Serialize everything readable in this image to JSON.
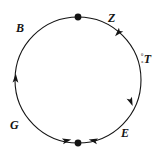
{
  "diagram": {
    "type": "circular-cycle-diagram",
    "background_color": "#ffffff",
    "stroke_color": "#141414",
    "circle": {
      "center_x": 78,
      "center_y": 80,
      "radius": 63,
      "stroke_width": 1.1
    },
    "labels": {
      "b": "B",
      "z": "Z",
      "g": "G",
      "e": "E",
      "t_superscript": "0",
      "t_subscript": "a",
      "t_main": "T"
    },
    "node_markers": [
      {
        "name": "top-node",
        "x": 78,
        "y": 17,
        "radius": 3.4
      },
      {
        "name": "bottom-node",
        "x": 78,
        "y": 143,
        "radius": 3.4
      }
    ],
    "direction_arrows": [
      {
        "name": "arrow-upper-right",
        "x": 118,
        "y": 33,
        "angle": 132
      },
      {
        "name": "arrow-lower-right",
        "x": 131,
        "y": 102,
        "angle": 68
      },
      {
        "name": "arrow-bottom-right",
        "x": 92,
        "y": 140,
        "angle": 13
      },
      {
        "name": "arrow-bottom-left",
        "x": 66,
        "y": 140,
        "angle": 13
      },
      {
        "name": "arrow-left",
        "x": 16,
        "y": 78,
        "angle": -86
      }
    ]
  }
}
